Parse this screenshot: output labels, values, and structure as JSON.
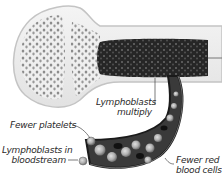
{
  "diagram": {
    "colors": {
      "bone": "#ececec",
      "bone_edge": "#c8c8c8",
      "spongy_holes": "#8a8a8a",
      "marrow": "#2a2a2a",
      "vessel": "#1e1e1e",
      "cell": "#b8b8b8",
      "text": "#2a2a2a"
    },
    "labels": {
      "lymphoblasts_multiply_line1": "Lymphoblasts",
      "lymphoblasts_multiply_line2": "multiply",
      "fewer_platelets": "Fewer platelets",
      "lymphoblasts_bloodstream_line1": "Lymphoblasts in",
      "lymphoblasts_bloodstream_line2": "bloodstream",
      "fewer_red_line1": "Fewer red",
      "fewer_red_line2": "blood cells"
    }
  }
}
